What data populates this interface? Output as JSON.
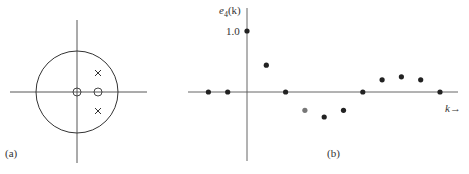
{
  "panel_a": {
    "label": "(a)",
    "title": "Pole-zero plot",
    "unit_circle": true,
    "zeros": [
      {
        "re": 0.0,
        "im": 0.0
      },
      {
        "re": 0.5,
        "im": 0.0
      }
    ],
    "poles": [
      {
        "re": 0.5,
        "im": 0.46
      },
      {
        "re": 0.5,
        "im": -0.46
      }
    ]
  },
  "panel_b": {
    "label": "(b)",
    "ylabel": "e4(k)",
    "ylabel_main": "e",
    "ylabel_sub": "4",
    "ylabel_arg": "(k)",
    "ytick": "1.0",
    "xlabel": "k→"
  },
  "chart_data": {
    "type": "scatter",
    "title": "",
    "xlabel": "k",
    "ylabel": "e4(k)",
    "x": [
      -2,
      -1,
      0,
      1,
      2,
      3,
      4,
      5,
      6,
      7,
      8,
      9,
      10
    ],
    "values": [
      0,
      0,
      1.0,
      0.44,
      0,
      -0.3,
      -0.41,
      -0.3,
      0,
      0.2,
      0.25,
      0.2,
      0
    ],
    "yticks": [
      "1.0"
    ],
    "ylim": [
      -0.8,
      1.2
    ],
    "grid": false,
    "legend": null
  }
}
